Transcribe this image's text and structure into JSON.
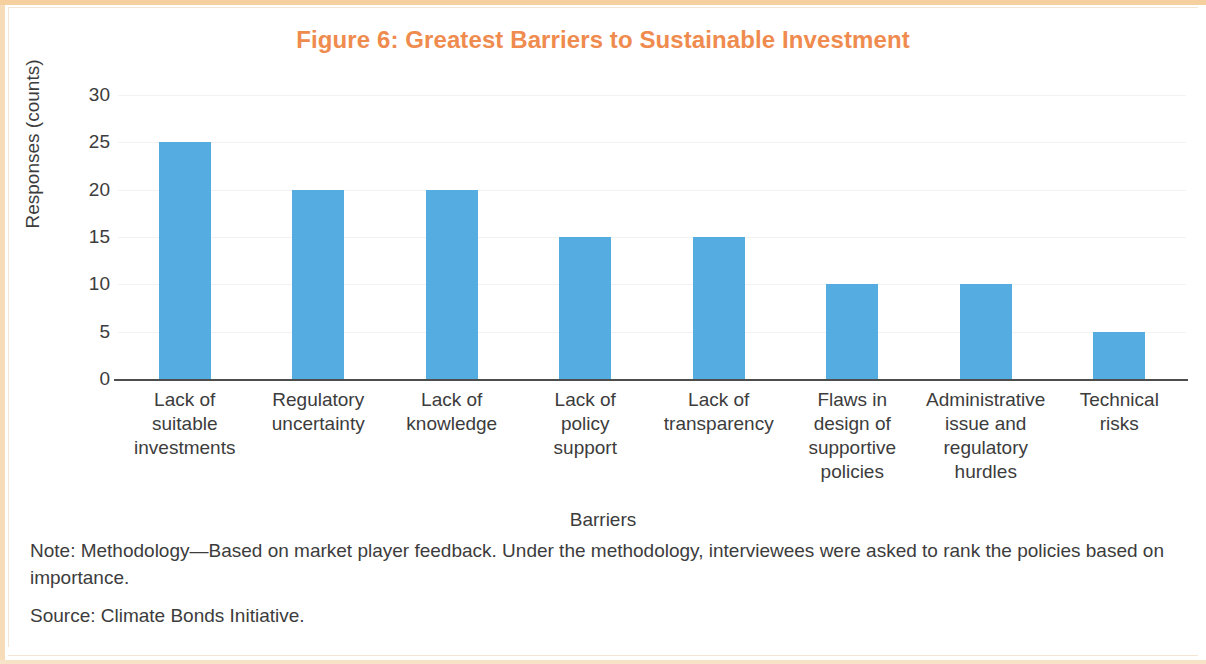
{
  "figure": {
    "title": "Figure 6: Greatest Barriers to Sustainable Investment",
    "title_color": "#EF8B4E",
    "bar_color": "#54ACE0",
    "note": "Note: Methodology—Based on market player feedback. Under the methodology, interviewees were asked to rank the policies based on importance.",
    "source": "Source: Climate Bonds Initiative."
  },
  "chart_data": {
    "type": "bar",
    "title": "Figure 6: Greatest Barriers to Sustainable Investment",
    "xlabel": "Barriers",
    "ylabel": "Responses (counts)",
    "categories": [
      "Lack of suitable investments",
      "Regulatory uncertainty",
      "Lack of knowledge",
      "Lack of policy support",
      "Lack of transparency",
      "Flaws in design of supportive policies",
      "Administrative issue and regulatory hurdles",
      "Technical risks"
    ],
    "category_lines": [
      [
        "Lack of",
        "suitable",
        "investments"
      ],
      [
        "Regulatory",
        "uncertainty"
      ],
      [
        "Lack of",
        "knowledge"
      ],
      [
        "Lack of",
        "policy",
        "support"
      ],
      [
        "Lack of",
        "transparency"
      ],
      [
        "Flaws in",
        "design of",
        "supportive",
        "policies"
      ],
      [
        "Administrative",
        "issue and",
        "regulatory",
        "hurdles"
      ],
      [
        "Technical",
        "risks"
      ]
    ],
    "values": [
      25,
      20,
      20,
      15,
      15,
      10,
      10,
      5
    ],
    "ylim": [
      0,
      30
    ],
    "yticks": [
      0,
      5,
      10,
      15,
      20,
      25,
      30
    ],
    "ytick_labels": [
      "0",
      "5",
      "10",
      "15",
      "20",
      "25",
      "30"
    ],
    "grid": true,
    "legend": null
  }
}
